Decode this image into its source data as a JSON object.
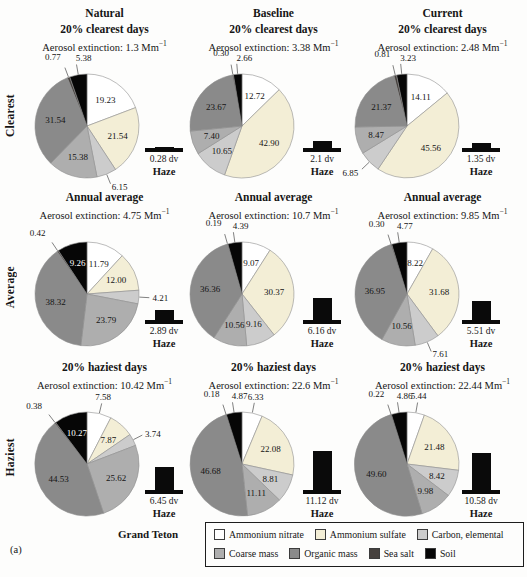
{
  "labels": {
    "extinction_prefix": "Aerosol extinction:",
    "extinction_unit": "Mm",
    "extinction_sup": "−1",
    "dv_unit": "dv",
    "haze": "Haze",
    "site": "Grand Teton",
    "panel_tag": "(a)"
  },
  "columns": [
    "Natural",
    "Baseline",
    "Current"
  ],
  "rows": [
    "Clearest",
    "Average",
    "Haziest"
  ],
  "legend": {
    "row1_count": 3
  },
  "chart_data": {
    "type": "pie",
    "layout": "3x3 grid of pie charts (columns: scenarios, rows: visibility conditions), each with a haze bar indicator in deciviews (dv)",
    "species": [
      "Ammonium nitrate",
      "Ammonium sulfate",
      "Carbon, elemental",
      "Coarse mass",
      "Organic mass",
      "Sea salt",
      "Soil"
    ],
    "colors": [
      "#ffffff",
      "#f3eed6",
      "#cccccc",
      "#aeaeae",
      "#8a8a8a",
      "#46413e",
      "#060606"
    ],
    "haze_bar_px_per_dv": 3.5,
    "grid": [
      {
        "column": "Natural",
        "row": "Clearest",
        "title": "20% clearest days",
        "extinction": "1.3",
        "values": [
          "19.23",
          "21.54",
          "6.15",
          "15.38",
          "31.54",
          "0.77",
          "5.38"
        ],
        "outside_labels": [
          2,
          5,
          6
        ],
        "haze_dv": "0.28"
      },
      {
        "column": "Baseline",
        "row": "Clearest",
        "title": "20% clearest days",
        "extinction": "3.38",
        "values": [
          "12.72",
          "42.90",
          "10.65",
          "7.40",
          "23.67",
          "0.30",
          "2.66"
        ],
        "outside_labels": [
          5,
          6
        ],
        "haze_dv": "2.1"
      },
      {
        "column": "Current",
        "row": "Clearest",
        "title": "20% clearest days",
        "extinction": "2.48",
        "values": [
          "14.11",
          "45.56",
          "6.85",
          "8.47",
          "21.37",
          "0.81",
          "3.23"
        ],
        "outside_labels": [
          2,
          5,
          6
        ],
        "haze_dv": "1.35"
      },
      {
        "column": "Natural",
        "row": "Average",
        "title": "Annual average",
        "extinction": "4.75",
        "values": [
          "11.79",
          "12.00",
          "4.21",
          "23.79",
          "38.32",
          "0.42",
          "9.26"
        ],
        "outside_labels": [
          2,
          5
        ],
        "haze_dv": "2.89"
      },
      {
        "column": "Baseline",
        "row": "Average",
        "title": "Annual average",
        "extinction": "10.7",
        "values": [
          "9.07",
          "30.37",
          "9.16",
          "10.56",
          "36.36",
          "0.19",
          "4.39"
        ],
        "outside_labels": [
          5,
          6
        ],
        "haze_dv": "6.16"
      },
      {
        "column": "Current",
        "row": "Average",
        "title": "Annual average",
        "extinction": "9.85",
        "values": [
          "8.22",
          "31.68",
          "7.61",
          "10.56",
          "36.95",
          "0.30",
          "4.77"
        ],
        "outside_labels": [
          2,
          5,
          6
        ],
        "haze_dv": "5.51"
      },
      {
        "column": "Natural",
        "row": "Haziest",
        "title": "20% haziest days",
        "extinction": "10.42",
        "values": [
          "7.58",
          "7.87",
          "3.74",
          "25.62",
          "44.53",
          "0.38",
          "10.27"
        ],
        "outside_labels": [
          0,
          2,
          5
        ],
        "haze_dv": "6.45"
      },
      {
        "column": "Baseline",
        "row": "Haziest",
        "title": "20% haziest days",
        "extinction": "22.6",
        "values": [
          "6.33",
          "22.08",
          "8.81",
          "11.11",
          "46.68",
          "0.18",
          "4.87"
        ],
        "outside_labels": [
          0,
          5,
          6
        ],
        "haze_dv": "11.12"
      },
      {
        "column": "Current",
        "row": "Haziest",
        "title": "20% haziest days",
        "extinction": "22.44",
        "values": [
          "5.44",
          "21.48",
          "8.42",
          "9.98",
          "49.60",
          "0.22",
          "4.86"
        ],
        "outside_labels": [
          0,
          5,
          6
        ],
        "haze_dv": "10.58"
      }
    ]
  }
}
